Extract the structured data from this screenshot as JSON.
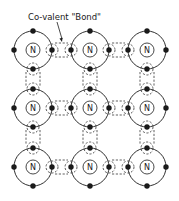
{
  "diagram": {
    "title": "Co-valent \"Bond\"",
    "label": {
      "text": "Co-valent \"Bond\"",
      "x": 28,
      "y": 20,
      "arrow": {
        "x1": 57,
        "y1": 22,
        "x2": 62,
        "y2": 42
      }
    },
    "atom_symbol": "N",
    "grid": {
      "columns": [
        33,
        90,
        147
      ],
      "rows": [
        50,
        108,
        167
      ]
    },
    "atom": {
      "outer_radius": 19,
      "inner_radius": 7,
      "electron_radius": 2.7,
      "bond_circle_radius": 6
    },
    "colors": {
      "line": "#1a1a1a",
      "background": "#ffffff"
    },
    "atoms": [
      {
        "row": 0,
        "col": 0,
        "symbol": "N"
      },
      {
        "row": 0,
        "col": 1,
        "symbol": "N"
      },
      {
        "row": 0,
        "col": 2,
        "symbol": "N"
      },
      {
        "row": 1,
        "col": 0,
        "symbol": "N"
      },
      {
        "row": 1,
        "col": 1,
        "symbol": "N"
      },
      {
        "row": 1,
        "col": 2,
        "symbol": "N"
      },
      {
        "row": 2,
        "col": 0,
        "symbol": "N"
      },
      {
        "row": 2,
        "col": 1,
        "symbol": "N"
      },
      {
        "row": 2,
        "col": 2,
        "symbol": "N"
      }
    ]
  }
}
